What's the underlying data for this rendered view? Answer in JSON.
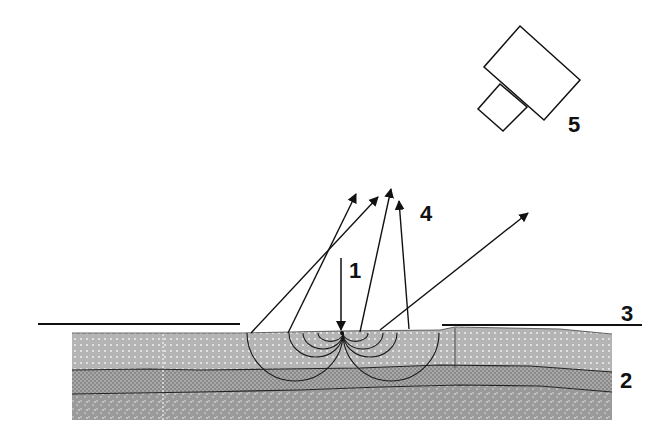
{
  "diagram": {
    "labels": [
      {
        "id": "1",
        "text": "1",
        "meaning": "incident pulse (downward arrow)"
      },
      {
        "id": "2",
        "text": "2",
        "meaning": "layered sample"
      },
      {
        "id": "3",
        "text": "3",
        "meaning": "surface line"
      },
      {
        "id": "4",
        "text": "4",
        "meaning": "reflected / emitted rays"
      },
      {
        "id": "5",
        "text": "5",
        "meaning": "detector / camera"
      }
    ],
    "colors": {
      "line": "#111111",
      "top_layer": "#b9b9b9",
      "middle_layer": "#8e8e8e",
      "bottom_layer": "#a2a2a2",
      "background": "#ffffff"
    }
  }
}
